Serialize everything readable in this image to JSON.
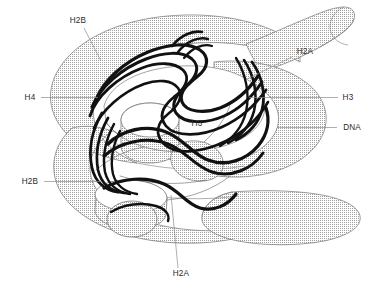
{
  "figure": {
    "type": "schematic-diagram",
    "background_color": "#ffffff",
    "width": 379,
    "height": 287
  },
  "palette": {
    "dna_fill": "#d9d9d9",
    "dna_stipple_dot": "#9a9a9a",
    "dna_outline": "#7b7b7b",
    "histone_trace": "#111111",
    "histone_thin": "#6e6e6e",
    "leader_line": "#8d8d8d",
    "label_text": "#2b2b2b"
  },
  "callouts": [
    {
      "id": "h2b-top",
      "label": "H2B",
      "text_x": 78,
      "text_y": 23,
      "anchor": "middle",
      "leader": "M 84 28 L 101 61"
    },
    {
      "id": "h2a-right",
      "label": "H2A",
      "text_x": 305,
      "text_y": 54,
      "anchor": "middle",
      "leader": "M 292 57 L 247 79"
    },
    {
      "id": "h4-left",
      "label": "H4",
      "text_x": 30,
      "text_y": 100,
      "anchor": "middle",
      "leader": "M 41 97.5 L 98 97.5"
    },
    {
      "id": "h3-right",
      "label": "H3",
      "text_x": 348,
      "text_y": 100,
      "anchor": "middle",
      "leader": "M 338 97.5 L 249 97.5"
    },
    {
      "id": "dna-right",
      "label": "DNA",
      "text_x": 352,
      "text_y": 130,
      "anchor": "middle",
      "leader": "M 337 127.5 L 277 127.5"
    },
    {
      "id": "h3-center",
      "label": "H3",
      "text_x": 197,
      "text_y": 126,
      "anchor": "middle",
      "leader": ""
    },
    {
      "id": "h2b-bottom",
      "label": "H2B",
      "text_x": 30,
      "text_y": 184,
      "anchor": "middle",
      "leader": "M 44 181.5 L 101 181.5"
    },
    {
      "id": "h2a-bottom",
      "label": "H2A",
      "text_x": 181,
      "text_y": 276,
      "anchor": "middle",
      "leader": "M 178 268 L 171 195"
    }
  ],
  "dna_superhelix": {
    "name": "DNA double helix superhelical ramp",
    "description": "Wide stippled gray ribbon making roughly 1.75 left-handed superhelical turns around the histone octamer core",
    "turns": 1.75,
    "segments": [
      "upper-back-ramp",
      "upper-right-free-end-tube",
      "lower-front-ramp",
      "lower-right-free-end-tube"
    ]
  },
  "histone_core": {
    "name": "Histone octamer core",
    "description": "Interlocking wavy alpha-helical backbone ribbons drawn as thick black traces",
    "proteins": [
      "H2A",
      "H2B",
      "H3",
      "H4"
    ],
    "copies_each": 2,
    "total_subunits": 8
  }
}
